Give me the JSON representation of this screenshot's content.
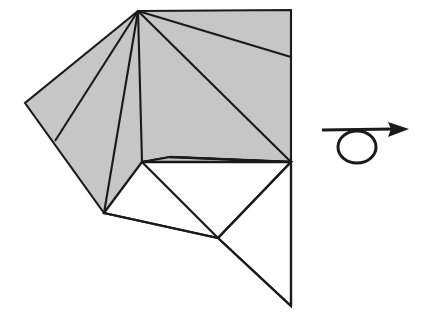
{
  "figure": {
    "kind": "origami-fold-step-diagram",
    "canvas": {
      "width": 430,
      "height": 326
    },
    "background_color": "#ffffff",
    "line_color": "#1a1a1a",
    "shaded_face_color": "#c6c6c6",
    "white_face_color": "#ffffff"
  },
  "vertices": {
    "apex": {
      "x": 138,
      "y": 11
    },
    "top_right": {
      "x": 291,
      "y": 10
    },
    "right_edge_crease": {
      "x": 291,
      "y": 57
    },
    "left_corner": {
      "x": 25,
      "y": 103
    },
    "left_edge_crease": {
      "x": 55,
      "y": 141
    },
    "lower_left_vertex": {
      "x": 104,
      "y": 213
    },
    "sliver_left_tip": {
      "x": 142,
      "y": 162
    },
    "sliver_inner": {
      "x": 170,
      "y": 157
    },
    "mid_right_junction": {
      "x": 291,
      "y": 162
    },
    "lower_junction": {
      "x": 218,
      "y": 238
    },
    "bottom_tip": {
      "x": 291,
      "y": 306
    }
  },
  "shapes": [
    {
      "name": "shaded-upper-body",
      "kind": "filled-polygon",
      "fill": "#c6c6c6",
      "points": "138,11 291,10 291,162 170,157 142,162 104,213 25,103"
    },
    {
      "name": "white-flap-triangle",
      "kind": "filled-polygon",
      "fill": "#ffffff",
      "points": "142,162 291,162 218,238 104,213"
    },
    {
      "name": "white-lower-tail",
      "kind": "filled-polygon",
      "fill": "#ffffff",
      "points": "218,238 291,162 291,306"
    },
    {
      "name": "gray-sliver",
      "kind": "filled-polygon",
      "fill": "#c6c6c6",
      "points": "170,157 291,162 142,162"
    }
  ],
  "creases": [
    {
      "name": "crease-apex-to-left-edge",
      "from": "apex",
      "to": "left_edge_crease"
    },
    {
      "name": "crease-apex-to-lower-left",
      "from": "apex",
      "to": "lower_left_vertex"
    },
    {
      "name": "crease-apex-to-sliver-tip",
      "from": "apex",
      "to": "sliver_left_tip"
    },
    {
      "name": "crease-apex-to-mid-right",
      "from": "apex",
      "to": "mid_right_junction"
    },
    {
      "name": "crease-apex-to-right-edge",
      "from": "apex",
      "to": "right_edge_crease"
    },
    {
      "name": "crease-lower-junction-to-mid-right",
      "from": "lower_junction",
      "to": "mid_right_junction"
    },
    {
      "name": "crease-lower-left-to-lower-junction",
      "from": "lower_left_vertex",
      "to": "lower_junction"
    },
    {
      "name": "crease-sliver-tip-to-lower-junction",
      "from": "sliver_left_tip",
      "to": "lower_junction"
    },
    {
      "name": "crease-lower-junction-to-bottom-tip",
      "from": "lower_junction",
      "to": "bottom_tip"
    }
  ],
  "turnover_symbol": {
    "name": "turn-over-arrow",
    "meaning": "turn the model over",
    "shaft": {
      "x1": 322,
      "y1": 130,
      "x2": 396,
      "y2": 129
    },
    "loop": {
      "cx": 357,
      "cy": 147,
      "rx": 19,
      "ry": 16
    },
    "arrowhead": {
      "tip_x": 409,
      "tip_y": 129,
      "back_x": 389,
      "half_height": 8
    }
  },
  "labels": {
    "step_caption": "",
    "annotations": []
  }
}
